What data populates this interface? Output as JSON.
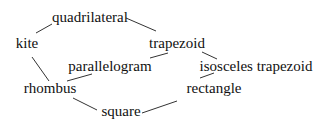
{
  "diagram": {
    "type": "hierarchy-graph",
    "nodes": [
      {
        "id": "quadrilateral",
        "label": "quadrilateral",
        "x": 90,
        "y": 17
      },
      {
        "id": "kite",
        "label": "kite",
        "x": 27,
        "y": 43
      },
      {
        "id": "trapezoid",
        "label": "trapezoid",
        "x": 177,
        "y": 43
      },
      {
        "id": "parallelogram",
        "label": "parallelogram",
        "x": 110,
        "y": 66
      },
      {
        "id": "isosceles_trapezoid",
        "label": "isosceles trapezoid",
        "x": 256,
        "y": 66
      },
      {
        "id": "rhombus",
        "label": "rhombus",
        "x": 50,
        "y": 88
      },
      {
        "id": "rectangle",
        "label": "rectangle",
        "x": 214,
        "y": 88
      },
      {
        "id": "square",
        "label": "square",
        "x": 121,
        "y": 111
      }
    ],
    "edges": [
      {
        "from": "kite",
        "to": "quadrilateral",
        "x1": 36,
        "y1": 33,
        "x2": 52,
        "y2": 24
      },
      {
        "from": "quadrilateral",
        "to": "trapezoid",
        "x1": 126,
        "y1": 18,
        "x2": 156,
        "y2": 31
      },
      {
        "from": "trapezoid",
        "to": "parallelogram",
        "x1": 168,
        "y1": 53,
        "x2": 150,
        "y2": 58
      },
      {
        "from": "trapezoid",
        "to": "isosceles_trapezoid",
        "x1": 202,
        "y1": 52,
        "x2": 217,
        "y2": 59
      },
      {
        "from": "kite",
        "to": "rhombus",
        "x1": 32,
        "y1": 57,
        "x2": 49,
        "y2": 81
      },
      {
        "from": "parallelogram",
        "to": "rhombus",
        "x1": 92,
        "y1": 74,
        "x2": 67,
        "y2": 81
      },
      {
        "from": "rhombus",
        "to": "square",
        "x1": 73,
        "y1": 98,
        "x2": 97,
        "y2": 110
      },
      {
        "from": "rectangle",
        "to": "square",
        "x1": 177,
        "y1": 101,
        "x2": 142,
        "y2": 113
      },
      {
        "from": "isosceles_trapezoid",
        "to": "rectangle",
        "x1": 214,
        "y1": 73,
        "x2": 200,
        "y2": 78
      }
    ]
  }
}
